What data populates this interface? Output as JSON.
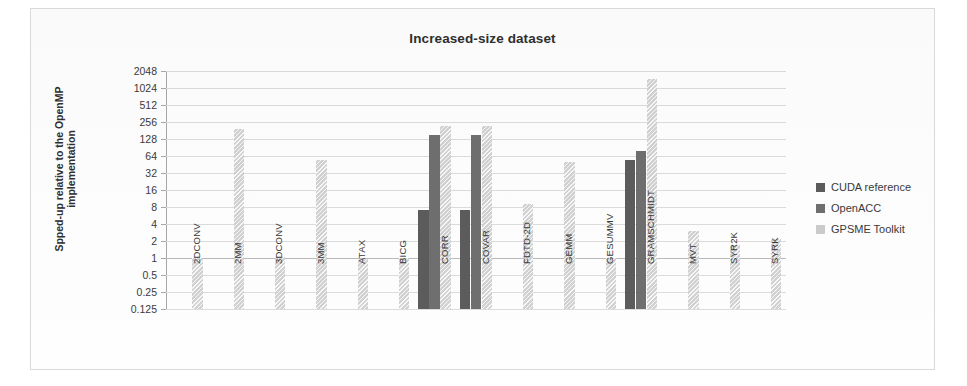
{
  "chart_data": {
    "type": "bar",
    "title": "Increased-size dataset",
    "xlabel": "",
    "ylabel": "Spped-up relative to the OpenMP implementation",
    "ylabel_lines": [
      "Spped-up relative to the OpenMP",
      "implementation"
    ],
    "scale": "log2",
    "ylim": [
      0.125,
      2048
    ],
    "ytick_labels": [
      "2048",
      "1024",
      "512",
      "256",
      "128",
      "64",
      "32",
      "16",
      "8",
      "4",
      "2",
      "1",
      "0.5",
      "0.25",
      "0.125"
    ],
    "ytick_values": [
      2048,
      1024,
      512,
      256,
      128,
      64,
      32,
      16,
      8,
      4,
      2,
      1,
      0.5,
      0.25,
      0.125
    ],
    "grid": true,
    "legend_position": "right",
    "categories": [
      "2DCONV",
      "2MM",
      "3DCONV",
      "3MM",
      "ATAX",
      "BICG",
      "CORR",
      "COVAR",
      "FDTD-2D",
      "GEMM",
      "GESUMMV",
      "GRAMSCHMIDT",
      "MVT",
      "SYR2K",
      "SYRK"
    ],
    "series": [
      {
        "name": "CUDA reference",
        "color": "#5c5c5c",
        "values": [
          null,
          null,
          null,
          null,
          null,
          null,
          7,
          7,
          null,
          null,
          null,
          55,
          null,
          null,
          null
        ]
      },
      {
        "name": "OpenACC",
        "color": "#6f6f6f",
        "values": [
          null,
          null,
          null,
          null,
          null,
          null,
          150,
          150,
          null,
          null,
          null,
          80,
          null,
          null,
          null
        ]
      },
      {
        "name": "GPSME Toolkit",
        "color": "#cccccc",
        "values": [
          1.0,
          190,
          1.05,
          55,
          0.95,
          1.0,
          220,
          220,
          9,
          50,
          1.0,
          1450,
          3.0,
          1.7,
          2.2
        ]
      }
    ]
  },
  "legend": {
    "items": [
      {
        "label": "CUDA reference"
      },
      {
        "label": "OpenACC"
      },
      {
        "label": "GPSME Toolkit"
      }
    ]
  }
}
